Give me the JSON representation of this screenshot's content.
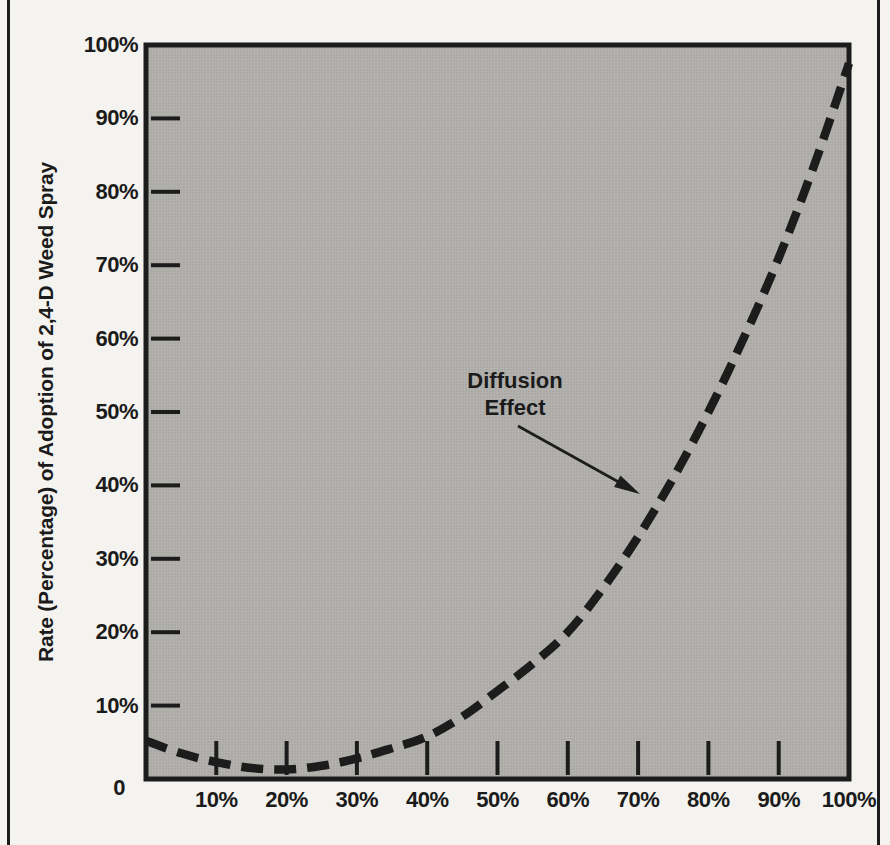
{
  "figure": {
    "frame_color": "#1c1c1c",
    "page_background": "#f5f3ef"
  },
  "chart_data": {
    "type": "line",
    "title": "",
    "xlabel": "",
    "ylabel": "Rate (Percentage) of Adoption of 2,4-D Weed Spray",
    "y_axis_title": "Rate (Percentage) of Adoption of 2,4-D Weed Spray",
    "xlim": [
      0,
      100
    ],
    "ylim": [
      0,
      100
    ],
    "grid": false,
    "plot_background": "#b4b2ae",
    "line_color": "#1c1c1c",
    "line_style": "dashed",
    "x_ticks": [
      {
        "value": 10,
        "label": "10%"
      },
      {
        "value": 20,
        "label": "20%"
      },
      {
        "value": 30,
        "label": "30%"
      },
      {
        "value": 40,
        "label": "40%"
      },
      {
        "value": 50,
        "label": "50%"
      },
      {
        "value": 60,
        "label": "60%"
      },
      {
        "value": 70,
        "label": "70%"
      },
      {
        "value": 80,
        "label": "80%"
      },
      {
        "value": 90,
        "label": "90%"
      },
      {
        "value": 100,
        "label": "100%"
      }
    ],
    "y_ticks": [
      {
        "value": 100,
        "label": "100%"
      },
      {
        "value": 90,
        "label": "90%"
      },
      {
        "value": 80,
        "label": "80%"
      },
      {
        "value": 70,
        "label": "70%"
      },
      {
        "value": 60,
        "label": "60%"
      },
      {
        "value": 50,
        "label": "50%"
      },
      {
        "value": 40,
        "label": "40%"
      },
      {
        "value": 30,
        "label": "30%"
      },
      {
        "value": 20,
        "label": "20%"
      },
      {
        "value": 10,
        "label": "10%"
      },
      {
        "value": 0,
        "label": "0"
      }
    ],
    "annotation": {
      "line1": "Diffusion",
      "line2": "Effect"
    },
    "series": [
      {
        "name": "Diffusion Effect",
        "points": [
          [
            0,
            5.2
          ],
          [
            5,
            3.5
          ],
          [
            10,
            2.3
          ],
          [
            15,
            1.5
          ],
          [
            20,
            1.3
          ],
          [
            25,
            1.8
          ],
          [
            30,
            2.8
          ],
          [
            35,
            4.2
          ],
          [
            40,
            5.8
          ],
          [
            45,
            8.5
          ],
          [
            50,
            12.0
          ],
          [
            55,
            15.7
          ],
          [
            60,
            20.0
          ],
          [
            65,
            26.0
          ],
          [
            70,
            33.0
          ],
          [
            75,
            41.0
          ],
          [
            80,
            50.0
          ],
          [
            85,
            60.0
          ],
          [
            90,
            71.0
          ],
          [
            95,
            83.5
          ],
          [
            100,
            97.5
          ]
        ]
      }
    ]
  }
}
